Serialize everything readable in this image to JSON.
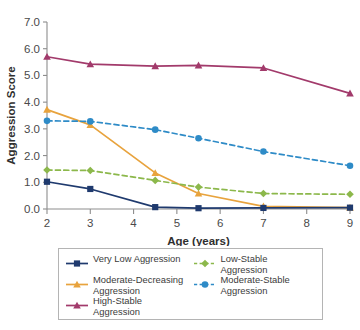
{
  "chart_data": {
    "type": "line",
    "title": "",
    "xlabel": "Age (years)",
    "ylabel": "Aggression Score",
    "xlim": [
      2,
      9
    ],
    "ylim": [
      0.0,
      7.0
    ],
    "xticks": [
      2,
      3,
      4,
      5,
      6,
      7,
      8,
      9
    ],
    "xtick_labels": [
      "2",
      "3",
      "4",
      "5",
      "6",
      "7",
      "8",
      "9"
    ],
    "yticks": [
      0.0,
      1.0,
      2.0,
      3.0,
      4.0,
      5.0,
      6.0,
      7.0
    ],
    "ytick_labels": [
      "0.0",
      "1.0",
      "2.0",
      "3.0",
      "4.0",
      "5.0",
      "6.0",
      "7.0"
    ],
    "grid": false,
    "legend_position": "below",
    "x": [
      2,
      3,
      4.5,
      5.5,
      7,
      9
    ],
    "series": [
      {
        "name": "Very Low Aggression",
        "values": [
          1.02,
          0.75,
          0.07,
          0.03,
          0.04,
          0.05
        ],
        "color": "#1F3A6E",
        "marker": "square",
        "linestyle": "solid"
      },
      {
        "name": "Moderate-Decreasing\nAggression",
        "legend_label": "Moderate-Decreasing Aggression",
        "values": [
          3.72,
          3.15,
          1.35,
          0.58,
          0.1,
          0.05
        ],
        "color": "#E8A33D",
        "marker": "triangle",
        "linestyle": "solid"
      },
      {
        "name": "High-Stable Aggression",
        "values": [
          5.7,
          5.42,
          5.35,
          5.38,
          5.28,
          4.33
        ],
        "color": "#A23A6B",
        "marker": "triangle",
        "linestyle": "solid"
      },
      {
        "name": "Low-Stable Aggression",
        "values": [
          1.46,
          1.44,
          1.07,
          0.82,
          0.58,
          0.55
        ],
        "color": "#8CB84B",
        "marker": "diamond",
        "linestyle": "dashed"
      },
      {
        "name": "Moderate-Stable\nAggression",
        "legend_label": "Moderate-Stable Aggression",
        "values": [
          3.3,
          3.28,
          2.97,
          2.65,
          2.15,
          1.62
        ],
        "color": "#2E8BC7",
        "marker": "circle",
        "linestyle": "dashed"
      }
    ]
  },
  "legend": {
    "entries": [
      {
        "label": "Very Low Aggression",
        "series_index": 0,
        "column": "left"
      },
      {
        "label": "Low-Stable Aggression",
        "series_index": 3,
        "column": "right"
      },
      {
        "label": "Moderate-Decreasing\nAggression",
        "series_index": 1,
        "column": "left"
      },
      {
        "label": "Moderate-Stable\nAggression",
        "series_index": 4,
        "column": "right"
      },
      {
        "label": "High-Stable Aggression",
        "series_index": 2,
        "column": "left"
      }
    ]
  }
}
